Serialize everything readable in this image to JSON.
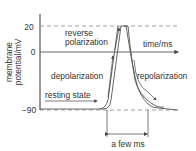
{
  "diagram": {
    "y_axis": {
      "label_line1": "membrane",
      "label_line2": "potential/mV",
      "ticks": [
        "20",
        "0",
        "−90"
      ]
    },
    "x_axis": {
      "label": "time/ms"
    },
    "annotations": {
      "reverse_line1": "reverse",
      "reverse_line2": "polarization",
      "depolarization": "depolarization",
      "repolarization": "repolarization",
      "resting": "resting state",
      "duration": "a few ms"
    },
    "colors": {
      "line": "#555555",
      "text": "#333333",
      "dash": "#888888"
    }
  }
}
